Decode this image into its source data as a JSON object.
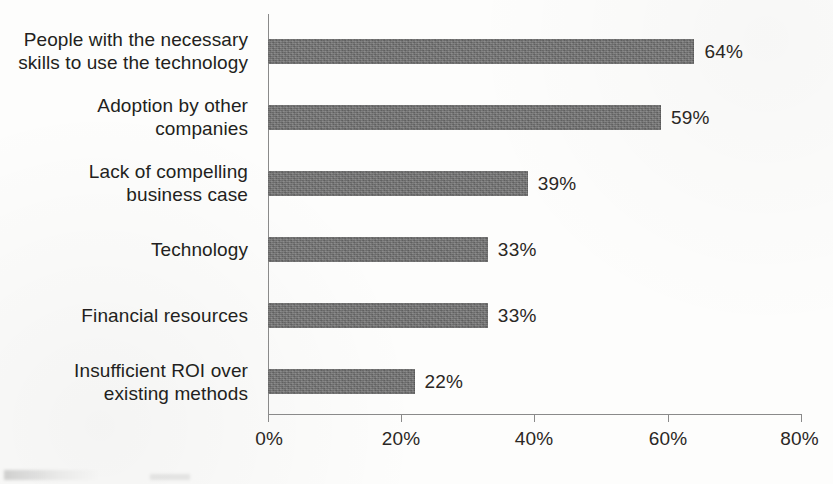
{
  "chart_data": {
    "type": "bar",
    "orientation": "horizontal",
    "title": "",
    "xlabel": "",
    "ylabel": "",
    "xlim": [
      0,
      80
    ],
    "grid": false,
    "legend": false,
    "value_suffix": "%",
    "categories": [
      "People with the necessary skills to use the technology",
      "Adoption by other companies",
      "Lack of compelling business case",
      "Technology",
      "Financial resources",
      "Insufficient ROI over existing methods"
    ],
    "category_lines": [
      [
        "People with the necessary",
        "skills to use the technology"
      ],
      [
        "Adoption by other",
        "companies"
      ],
      [
        "Lack of compelling",
        "business case"
      ],
      [
        "Technology"
      ],
      [
        "Financial resources"
      ],
      [
        "Insufficient ROI over",
        "existing methods"
      ]
    ],
    "values": [
      64,
      59,
      39,
      33,
      33,
      22
    ],
    "value_labels": [
      "64%",
      "59%",
      "39%",
      "33%",
      "33%",
      "22%"
    ],
    "xticks": [
      0,
      20,
      40,
      60,
      80
    ],
    "xtick_labels": [
      "0%",
      "20%",
      "40%",
      "60%",
      "80%"
    ],
    "bar_color": "#6e6e6e",
    "axis_color": "#8a8a8a",
    "text_color": "#231f20",
    "background_color": "#fdfdfc"
  }
}
